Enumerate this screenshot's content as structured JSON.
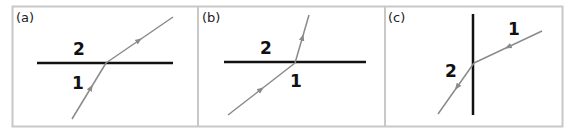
{
  "figure": {
    "frame_color": "#c8c8c8",
    "surface_color": "#111111",
    "ray_color": "#8a8a8a",
    "panels": [
      {
        "id": "a",
        "label": "(a)",
        "medium_above": "2",
        "medium_below": "1",
        "orientation": "horizontal-boundary",
        "ray_direction": "from medium 1 (below) into medium 2 (above), bending away from normal"
      },
      {
        "id": "b",
        "label": "(b)",
        "medium_above": "2",
        "medium_below": "1",
        "orientation": "horizontal-boundary",
        "ray_direction": "from medium 1 (below) into medium 2 (above), bending toward normal"
      },
      {
        "id": "c",
        "label": "(c)",
        "medium_right": "1",
        "medium_left": "2",
        "orientation": "vertical-boundary",
        "ray_direction": "from medium 1 (right) into medium 2 (left), bending toward boundary"
      }
    ]
  }
}
